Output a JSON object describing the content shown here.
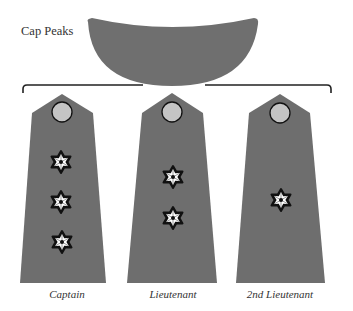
{
  "diagram": {
    "cap_label": "Cap Peaks",
    "colors": {
      "board_fill": "#6e6e6e",
      "cap_fill": "#6f6f6f",
      "button_fill": "#c4c4c4",
      "button_stroke": "#111111",
      "star_fill": "#ffffff",
      "star_stroke": "#111111",
      "bracket": "#222222"
    },
    "boards": [
      {
        "rank": "Captain",
        "label": "Captain",
        "stars": 3
      },
      {
        "rank": "Lieutenant",
        "label": "Lieutenant",
        "stars": 2
      },
      {
        "rank": "2nd Lieutenant",
        "label": "2nd Lieutenant",
        "stars": 1
      }
    ]
  }
}
